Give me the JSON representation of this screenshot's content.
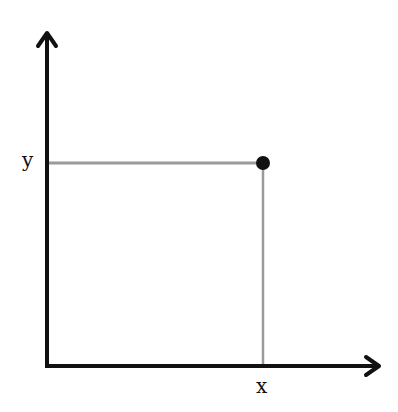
{
  "diagram": {
    "type": "coordinate-point",
    "x_axis_label": "x",
    "y_axis_label": "y",
    "point_label": "",
    "colors": {
      "axis": "#111111",
      "guide": "#9a9a9a",
      "point": "#111111",
      "background": "#ffffff"
    }
  }
}
